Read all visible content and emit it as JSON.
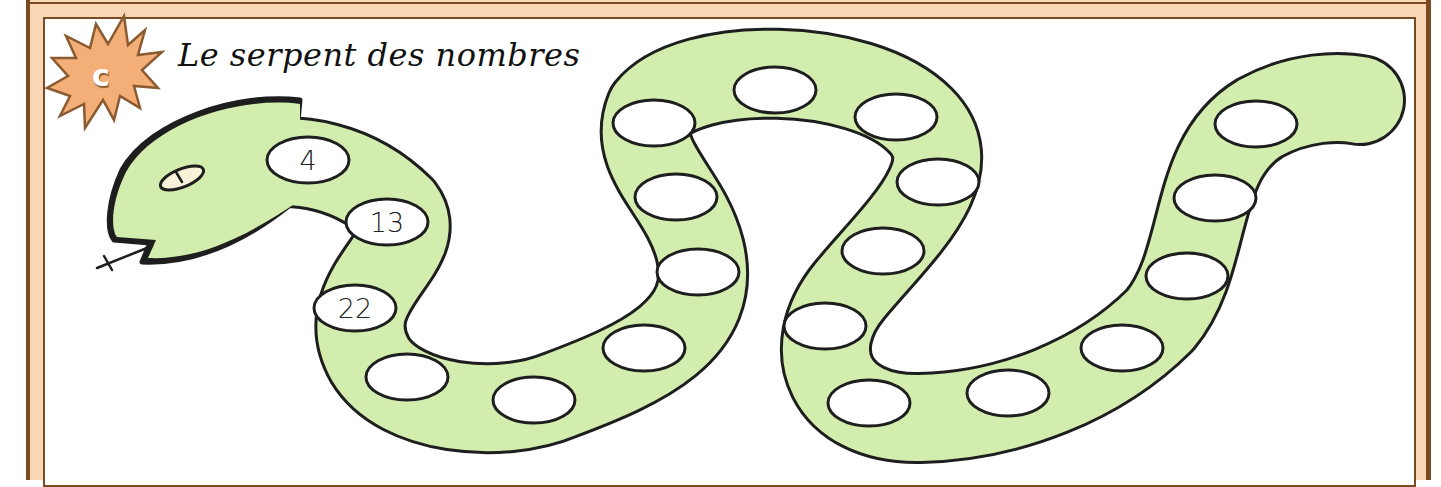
{
  "title": "Le serpent des nombres",
  "badge": {
    "letter": "c",
    "shape": "starburst",
    "color": "#f4ae78",
    "outline": "#8a5a30"
  },
  "colors": {
    "frame_band": "#f9d6b4",
    "frame_line": "#7a4a22",
    "snake_body": "#d2edae",
    "snake_outline": "#1e1e1e",
    "eye_fill": "#f6f3d8",
    "cell_fill": "#ffffff"
  },
  "snake": {
    "cells": [
      {
        "index": 1,
        "value": "4",
        "x": 308,
        "y": 160
      },
      {
        "index": 2,
        "value": "13",
        "x": 387,
        "y": 222
      },
      {
        "index": 3,
        "value": "22",
        "x": 355,
        "y": 308
      },
      {
        "index": 4,
        "value": "",
        "x": 407,
        "y": 377
      },
      {
        "index": 5,
        "value": "",
        "x": 534,
        "y": 400
      },
      {
        "index": 6,
        "value": "",
        "x": 644,
        "y": 348
      },
      {
        "index": 7,
        "value": "",
        "x": 698,
        "y": 272
      },
      {
        "index": 8,
        "value": "",
        "x": 676,
        "y": 197
      },
      {
        "index": 9,
        "value": "",
        "x": 654,
        "y": 123
      },
      {
        "index": 10,
        "value": "",
        "x": 775,
        "y": 90
      },
      {
        "index": 11,
        "value": "",
        "x": 896,
        "y": 117
      },
      {
        "index": 12,
        "value": "",
        "x": 938,
        "y": 182
      },
      {
        "index": 13,
        "value": "",
        "x": 883,
        "y": 251
      },
      {
        "index": 14,
        "value": "",
        "x": 825,
        "y": 326
      },
      {
        "index": 15,
        "value": "",
        "x": 869,
        "y": 403
      },
      {
        "index": 16,
        "value": "",
        "x": 1008,
        "y": 393
      },
      {
        "index": 17,
        "value": "",
        "x": 1122,
        "y": 348
      },
      {
        "index": 18,
        "value": "",
        "x": 1187,
        "y": 276
      },
      {
        "index": 19,
        "value": "",
        "x": 1215,
        "y": 198
      },
      {
        "index": 20,
        "value": "",
        "x": 1256,
        "y": 124
      }
    ]
  }
}
